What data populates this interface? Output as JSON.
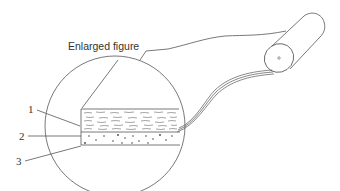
{
  "diagram": {
    "title_label": "Enlarged figure",
    "callouts": [
      {
        "number": "1",
        "target": "top layer (wavy fibrous texture)"
      },
      {
        "number": "2",
        "target": "middle layer (dotted particles)"
      },
      {
        "number": "3",
        "target": "bottom layer line"
      }
    ],
    "components": [
      "magnified circle",
      "three-layer cross-section",
      "roll of material",
      "unrolled strip"
    ],
    "colors": {
      "line": "#555555",
      "text": "#333333",
      "background": "#ffffff"
    }
  }
}
